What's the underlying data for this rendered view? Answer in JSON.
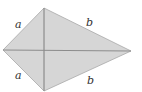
{
  "diagram": {
    "type": "kite",
    "colors": {
      "fill": "#d6d6d6",
      "edge": "#a8a8a8",
      "diagonal": "#8c8c8c",
      "label": "#333333"
    },
    "vertices": {
      "top": [
        44,
        8
      ],
      "left": [
        3,
        50
      ],
      "right": [
        131,
        51
      ],
      "bottom": [
        44,
        91
      ]
    },
    "labels": [
      {
        "id": "top-left-side",
        "text": "a",
        "x": 15,
        "y": 19
      },
      {
        "id": "top-right-side",
        "text": "b",
        "x": 86,
        "y": 17
      },
      {
        "id": "bottom-left-side",
        "text": "a",
        "x": 15,
        "y": 70
      },
      {
        "id": "bottom-right-side",
        "text": "b",
        "x": 87,
        "y": 75
      }
    ]
  }
}
